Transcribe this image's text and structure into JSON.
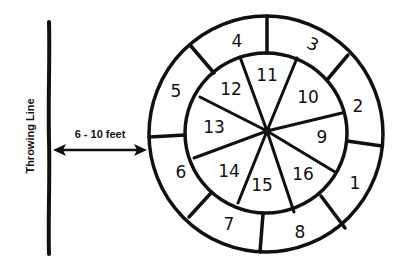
{
  "diagram": {
    "type": "target-board-layout",
    "throwing_line": {
      "label": "Throwing Line"
    },
    "distance": {
      "label": "6 - 10 feet"
    },
    "colors": {
      "ink": "#111111",
      "background": "#ffffff"
    },
    "target": {
      "outer_ring": {
        "sections": [
          {
            "number": "1"
          },
          {
            "number": "2"
          },
          {
            "number": "3"
          },
          {
            "number": "4"
          },
          {
            "number": "5"
          },
          {
            "number": "6"
          },
          {
            "number": "7"
          },
          {
            "number": "8"
          }
        ]
      },
      "inner_wedges": {
        "sections": [
          {
            "number": "9"
          },
          {
            "number": "10"
          },
          {
            "number": "11"
          },
          {
            "number": "12"
          },
          {
            "number": "13"
          },
          {
            "number": "14"
          },
          {
            "number": "15"
          },
          {
            "number": "16"
          }
        ]
      }
    }
  }
}
